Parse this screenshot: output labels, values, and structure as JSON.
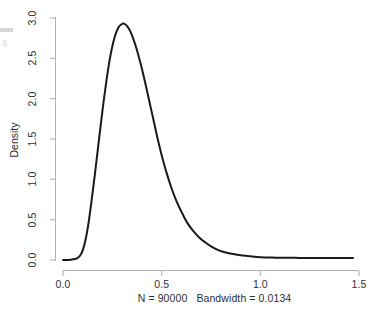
{
  "chart_data": {
    "type": "line",
    "title": "",
    "subtitle": "",
    "xlabel": "N = 90000   Bandwidth = 0.0134",
    "ylabel": "Density",
    "xlim": [
      0.0,
      1.5
    ],
    "ylim": [
      0.0,
      3.0
    ],
    "grid": false,
    "legend": "none",
    "annotations": [],
    "x_ticks": [
      "0.0",
      "0.5",
      "1.0",
      "1.5"
    ],
    "x_tick_values": [
      0.0,
      0.5,
      1.0,
      1.5
    ],
    "y_ticks": [
      "0.0",
      "0.5",
      "1.0",
      "1.5",
      "2.0",
      "2.5",
      "3.0"
    ],
    "y_tick_values": [
      0.0,
      0.5,
      1.0,
      1.5,
      2.0,
      2.5,
      3.0
    ],
    "series": [
      {
        "name": "density",
        "color": "#1a1a1a",
        "x": [
          0.0,
          0.03,
          0.055,
          0.07,
          0.085,
          0.1,
          0.115,
          0.13,
          0.145,
          0.16,
          0.175,
          0.19,
          0.205,
          0.22,
          0.235,
          0.25,
          0.265,
          0.28,
          0.295,
          0.31,
          0.325,
          0.34,
          0.355,
          0.37,
          0.385,
          0.4,
          0.42,
          0.44,
          0.46,
          0.48,
          0.5,
          0.525,
          0.55,
          0.575,
          0.6,
          0.63,
          0.66,
          0.69,
          0.72,
          0.75,
          0.79,
          0.83,
          0.87,
          0.91,
          0.95,
          1.0,
          1.06,
          1.12,
          1.2,
          1.28,
          1.36,
          1.44,
          1.47
        ],
        "y": [
          0.0,
          0.0,
          0.01,
          0.02,
          0.05,
          0.12,
          0.26,
          0.47,
          0.74,
          1.03,
          1.34,
          1.65,
          1.95,
          2.22,
          2.46,
          2.65,
          2.79,
          2.88,
          2.92,
          2.93,
          2.9,
          2.84,
          2.75,
          2.64,
          2.51,
          2.37,
          2.16,
          1.94,
          1.72,
          1.5,
          1.3,
          1.08,
          0.89,
          0.73,
          0.6,
          0.46,
          0.36,
          0.28,
          0.22,
          0.17,
          0.12,
          0.09,
          0.07,
          0.055,
          0.045,
          0.035,
          0.03,
          0.028,
          0.026,
          0.025,
          0.024,
          0.024,
          0.024
        ],
        "peak_x": 0.31,
        "peak_y": 2.93
      }
    ]
  },
  "axes": {
    "axis_color": "#b3b3b3",
    "tick_color": "#b3b3b3",
    "label_color": "#2f2f2f"
  }
}
